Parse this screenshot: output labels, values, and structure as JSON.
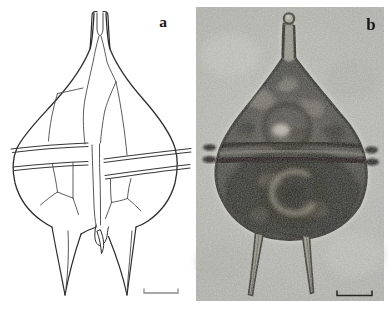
{
  "figure": {
    "kind": "two-panel scientific figure of an armored dinoflagellate cell",
    "background": "#ffffff",
    "panels": [
      {
        "label": "a",
        "media": "line drawing",
        "subject": "dinoflagellate cell in ventral view: open apical horn, plated epitheca with sutures, displaced cingulum with lists, sulcus, two winged antapical horns",
        "scale_bar": "unlabeled bracket scale bar",
        "ink": "#333333"
      },
      {
        "label": "b",
        "media": "light micrograph",
        "subject": "same dinoflagellate cell: knobbed apical horn, dark granular protoplast, cingulum band with lists, two divergent antapical spines",
        "scale_bar": "unlabeled bracket scale bar",
        "photo_background": "#b5b5b0",
        "cell_tone": "#3b3a35"
      }
    ]
  }
}
